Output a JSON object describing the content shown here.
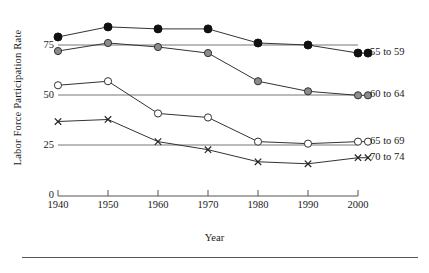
{
  "chart_data": {
    "type": "line",
    "title": "",
    "xlabel": "Year",
    "ylabel": "Labor Force Participation Rate",
    "x": [
      1940,
      1950,
      1960,
      1970,
      1980,
      1990,
      2000
    ],
    "xlim": [
      1940,
      2000
    ],
    "ylim": [
      0,
      87
    ],
    "yticks": [
      0,
      25,
      50,
      75
    ],
    "xticks": [
      1940,
      1950,
      1960,
      1970,
      1980,
      1990,
      2000
    ],
    "grid": "horizontal gridlines at 25, 50, 75; axis line at 0",
    "legend_position": "right of plot, at series end",
    "series": [
      {
        "name": "55 to 59",
        "marker": "filled-circle",
        "color": "#111111",
        "values": [
          79,
          84,
          83,
          83,
          76,
          75,
          71
        ]
      },
      {
        "name": "60 to 64",
        "marker": "grey-circle",
        "color": "#8c8c8c",
        "values": [
          72,
          76,
          74,
          71,
          57,
          52,
          50
        ]
      },
      {
        "name": "65 to 69",
        "marker": "open-circle",
        "color": "#ffffff",
        "values": [
          55,
          57,
          41,
          39,
          27,
          26,
          27
        ]
      },
      {
        "name": "70 to 74",
        "marker": "cross",
        "color": "#222222",
        "values": [
          37,
          38,
          27,
          23,
          17,
          16,
          19
        ]
      }
    ]
  },
  "axis": {
    "ytick_labels": [
      "75",
      "50",
      "25",
      "0"
    ],
    "xtick_labels": [
      "1940",
      "1950",
      "1960",
      "1970",
      "1980",
      "1990",
      "2000"
    ]
  },
  "legend": {
    "items": [
      {
        "label": "55 to 59"
      },
      {
        "label": "60 to 64"
      },
      {
        "label": "65 to 69"
      },
      {
        "label": "70 to 74"
      }
    ]
  }
}
